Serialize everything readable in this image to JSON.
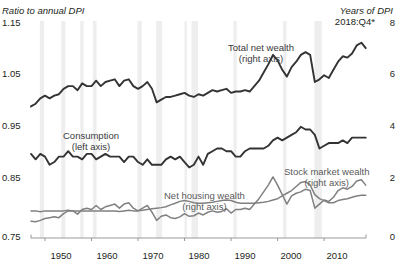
{
  "axes": {
    "left_title": "Ratio to annual DPI",
    "right_title": "Years of DPI",
    "right_subtitle": "2018:Q4*",
    "left_ticks": [
      "1.15",
      "1.05",
      "0.95",
      "0.85",
      "0.75"
    ],
    "right_ticks": [
      "8",
      "6",
      "4",
      "2",
      "0"
    ],
    "x_ticks": [
      "1950",
      "1960",
      "1970",
      "1980",
      "1990",
      "2000",
      "2010"
    ]
  },
  "labels": {
    "total_net_wealth": "Total net wealth",
    "total_net_wealth_axis": "(right axis)",
    "consumption": "Consumption",
    "consumption_axis": "(left axis)",
    "net_housing_wealth": "Net housing wealth",
    "net_housing_wealth_axis": "(right axis)",
    "stock_market_wealth": "Stock market wealth",
    "stock_market_wealth_axis": "(right axis)"
  },
  "colors": {
    "dark_line": "#333333",
    "gray_line": "#808080",
    "recession_band": "#eeeeee",
    "axis": "#808080",
    "text": "#231f20"
  },
  "chart_data": {
    "type": "line",
    "title": "",
    "xlabel": "",
    "ylabel": "Ratio to annual DPI",
    "y2label": "Years of DPI",
    "xlim": [
      1947,
      2019
    ],
    "ylim": [
      0.75,
      1.15
    ],
    "y2lim": [
      0,
      8
    ],
    "grid": false,
    "legend": "inline-annotations",
    "recession_bands": [
      [
        1948.9,
        1949.8
      ],
      [
        1953.5,
        1954.4
      ],
      [
        1957.6,
        1958.3
      ],
      [
        1960.3,
        1961.1
      ],
      [
        1969.9,
        1970.8
      ],
      [
        1973.9,
        1975.2
      ],
      [
        1980.0,
        1980.5
      ],
      [
        1981.5,
        1982.9
      ],
      [
        1990.5,
        1991.2
      ],
      [
        2001.2,
        2001.9
      ],
      [
        2007.9,
        2009.5
      ]
    ],
    "series": [
      {
        "name": "Total net wealth",
        "axis": "right",
        "color": "#333333",
        "units": "Years of DPI",
        "x": [
          1947,
          1948,
          1949,
          1950,
          1951,
          1952,
          1953,
          1954,
          1955,
          1956,
          1957,
          1958,
          1959,
          1960,
          1961,
          1962,
          1963,
          1964,
          1965,
          1966,
          1967,
          1968,
          1969,
          1970,
          1971,
          1972,
          1973,
          1974,
          1975,
          1976,
          1977,
          1978,
          1979,
          1980,
          1981,
          1982,
          1983,
          1984,
          1985,
          1986,
          1987,
          1988,
          1989,
          1990,
          1991,
          1992,
          1993,
          1994,
          1995,
          1996,
          1997,
          1998,
          1999,
          2000,
          2001,
          2002,
          2003,
          2004,
          2005,
          2006,
          2007,
          2008,
          2009,
          2010,
          2011,
          2012,
          2013,
          2014,
          2015,
          2016,
          2017,
          2018,
          2018.95
        ],
        "values": [
          4.85,
          4.95,
          5.15,
          5.25,
          5.15,
          5.25,
          5.3,
          5.5,
          5.6,
          5.6,
          5.45,
          5.7,
          5.6,
          5.6,
          5.8,
          5.6,
          5.75,
          5.8,
          5.85,
          5.6,
          5.8,
          5.85,
          5.6,
          5.5,
          5.6,
          5.75,
          5.5,
          5.0,
          5.1,
          5.2,
          5.2,
          5.25,
          5.3,
          5.35,
          5.25,
          5.2,
          5.3,
          5.25,
          5.35,
          5.45,
          5.4,
          5.45,
          5.5,
          5.35,
          5.4,
          5.4,
          5.45,
          5.4,
          5.6,
          5.8,
          6.1,
          6.4,
          6.75,
          6.55,
          6.2,
          5.95,
          6.3,
          6.5,
          6.75,
          6.85,
          6.75,
          5.75,
          5.85,
          6.0,
          5.9,
          6.2,
          6.5,
          6.7,
          6.65,
          6.8,
          7.1,
          7.2,
          7.0
        ]
      },
      {
        "name": "Consumption",
        "axis": "left",
        "color": "#333333",
        "units": "Ratio to annual DPI",
        "x": [
          1947,
          1948,
          1949,
          1950,
          1951,
          1952,
          1953,
          1954,
          1955,
          1956,
          1957,
          1958,
          1959,
          1960,
          1961,
          1962,
          1963,
          1964,
          1965,
          1966,
          1967,
          1968,
          1969,
          1970,
          1971,
          1972,
          1973,
          1974,
          1975,
          1976,
          1977,
          1978,
          1979,
          1980,
          1981,
          1982,
          1983,
          1984,
          1985,
          1986,
          1987,
          1988,
          1989,
          1990,
          1991,
          1992,
          1993,
          1994,
          1995,
          1996,
          1997,
          1998,
          1999,
          2000,
          2001,
          2002,
          2003,
          2004,
          2005,
          2006,
          2007,
          2008,
          2009,
          2010,
          2011,
          2012,
          2013,
          2014,
          2015,
          2016,
          2017,
          2018,
          2018.95
        ],
        "values": [
          0.905,
          0.895,
          0.905,
          0.9,
          0.885,
          0.89,
          0.9,
          0.9,
          0.91,
          0.9,
          0.9,
          0.895,
          0.905,
          0.905,
          0.895,
          0.9,
          0.905,
          0.9,
          0.9,
          0.9,
          0.89,
          0.9,
          0.9,
          0.89,
          0.885,
          0.895,
          0.885,
          0.885,
          0.885,
          0.895,
          0.9,
          0.895,
          0.9,
          0.89,
          0.88,
          0.885,
          0.9,
          0.885,
          0.905,
          0.91,
          0.915,
          0.915,
          0.91,
          0.91,
          0.9,
          0.9,
          0.91,
          0.915,
          0.915,
          0.915,
          0.915,
          0.92,
          0.93,
          0.935,
          0.93,
          0.935,
          0.94,
          0.945,
          0.955,
          0.95,
          0.95,
          0.94,
          0.915,
          0.92,
          0.925,
          0.925,
          0.925,
          0.93,
          0.925,
          0.935,
          0.935,
          0.935,
          0.935
        ]
      },
      {
        "name": "Net housing wealth",
        "axis": "right",
        "color": "#808080",
        "units": "Years of DPI",
        "x": [
          1947,
          1948,
          1949,
          1950,
          1951,
          1952,
          1953,
          1954,
          1955,
          1956,
          1957,
          1958,
          1959,
          1960,
          1961,
          1962,
          1963,
          1964,
          1965,
          1966,
          1967,
          1968,
          1969,
          1970,
          1971,
          1972,
          1973,
          1974,
          1975,
          1976,
          1977,
          1978,
          1979,
          1980,
          1981,
          1982,
          1983,
          1984,
          1985,
          1986,
          1987,
          1988,
          1989,
          1990,
          1991,
          1992,
          1993,
          1994,
          1995,
          1996,
          1997,
          1998,
          1999,
          2000,
          2001,
          2002,
          2003,
          2004,
          2005,
          2006,
          2007,
          2008,
          2009,
          2010,
          2011,
          2012,
          2013,
          2014,
          2015,
          2016,
          2017,
          2018,
          2018.95
        ],
        "values": [
          1.0,
          1.0,
          0.97,
          1.0,
          1.0,
          1.0,
          1.0,
          1.0,
          1.02,
          1.0,
          1.0,
          1.0,
          1.0,
          1.0,
          1.0,
          1.0,
          1.0,
          1.0,
          1.0,
          0.98,
          1.0,
          1.02,
          1.0,
          1.0,
          1.02,
          1.05,
          1.08,
          1.1,
          1.12,
          1.15,
          1.22,
          1.28,
          1.35,
          1.38,
          1.35,
          1.3,
          1.28,
          1.28,
          1.3,
          1.32,
          1.35,
          1.38,
          1.4,
          1.38,
          1.32,
          1.28,
          1.28,
          1.28,
          1.28,
          1.3,
          1.32,
          1.35,
          1.4,
          1.45,
          1.55,
          1.65,
          1.75,
          1.9,
          2.05,
          2.08,
          1.95,
          1.6,
          1.45,
          1.38,
          1.3,
          1.3,
          1.38,
          1.42,
          1.45,
          1.5,
          1.55,
          1.58,
          1.58
        ]
      },
      {
        "name": "Stock market wealth",
        "axis": "right",
        "color": "#808080",
        "units": "Years of DPI",
        "x": [
          1947,
          1948,
          1949,
          1950,
          1951,
          1952,
          1953,
          1954,
          1955,
          1956,
          1957,
          1958,
          1959,
          1960,
          1961,
          1962,
          1963,
          1964,
          1965,
          1966,
          1967,
          1968,
          1969,
          1970,
          1971,
          1972,
          1973,
          1974,
          1975,
          1976,
          1977,
          1978,
          1979,
          1980,
          1981,
          1982,
          1983,
          1984,
          1985,
          1986,
          1987,
          1988,
          1989,
          1990,
          1991,
          1992,
          1993,
          1994,
          1995,
          1996,
          1997,
          1998,
          1999,
          2000,
          2001,
          2002,
          2003,
          2004,
          2005,
          2006,
          2007,
          2008,
          2009,
          2010,
          2011,
          2012,
          2013,
          2014,
          2015,
          2016,
          2017,
          2018,
          2018.95
        ],
        "values": [
          0.62,
          0.6,
          0.65,
          0.72,
          0.75,
          0.78,
          0.75,
          0.9,
          1.0,
          1.0,
          0.88,
          1.05,
          1.1,
          1.05,
          1.2,
          1.05,
          1.15,
          1.2,
          1.25,
          1.1,
          1.25,
          1.3,
          1.1,
          1.0,
          1.1,
          1.2,
          0.95,
          0.65,
          0.8,
          0.85,
          0.75,
          0.72,
          0.78,
          0.9,
          0.8,
          0.82,
          0.92,
          0.85,
          0.95,
          1.0,
          0.95,
          0.98,
          1.08,
          0.92,
          1.05,
          1.05,
          1.1,
          1.05,
          1.25,
          1.45,
          1.7,
          1.95,
          2.25,
          1.95,
          1.6,
          1.25,
          1.55,
          1.65,
          1.7,
          1.8,
          1.75,
          1.1,
          1.25,
          1.4,
          1.35,
          1.5,
          1.75,
          1.85,
          1.8,
          1.9,
          2.1,
          2.15,
          1.95
        ]
      }
    ]
  },
  "source_note": ""
}
